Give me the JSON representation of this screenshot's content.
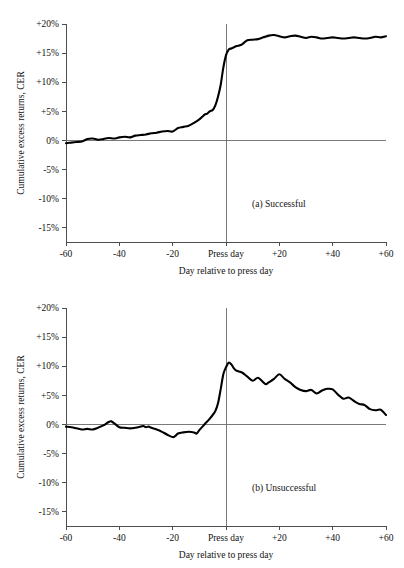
{
  "figure": {
    "title": "",
    "panels": [
      {
        "id": "a",
        "label": "(a)  Successful",
        "xlabel": "Day relative to press day",
        "ylabel": "Cumulative excess returns, CER"
      },
      {
        "id": "b",
        "label": "(b)  Unsuccessful",
        "xlabel": "Day relative to press day",
        "ylabel": "Cumulative excess returns, CER"
      }
    ],
    "y_tick_labels": [
      "+20%",
      "+15%",
      "+10%",
      "+5%",
      "0%",
      "-5%",
      "-10%",
      "-15%"
    ],
    "x_tick_labels": [
      "-60",
      "-40",
      "-20",
      "Press day",
      "+20",
      "+40",
      "+60"
    ],
    "colors": {
      "series": "#000000",
      "axis": "#4d4d4d",
      "reference": "#6b6b6b",
      "background": "#ffffff"
    }
  },
  "chart_data": [
    {
      "type": "line",
      "title": "(a)  Successful",
      "xlabel": "Day relative to press day",
      "ylabel": "Cumulative excess returns, CER",
      "xlim": [
        -60,
        60
      ],
      "ylim": [
        -17.5,
        20
      ],
      "xticks": [
        -60,
        -40,
        -20,
        0,
        20,
        40,
        60
      ],
      "xtick_labels": [
        "-60",
        "-40",
        "-20",
        "Press day",
        "+20",
        "+40",
        "+60"
      ],
      "yticks": [
        20,
        15,
        10,
        5,
        0,
        -5,
        -10,
        -15
      ],
      "ytick_labels": [
        "+20%",
        "+15%",
        "+10%",
        "+5%",
        "0%",
        "-5%",
        "-10%",
        "-15%"
      ],
      "grid": false,
      "legend": null,
      "reference_lines": [
        {
          "axis": "y",
          "value": 0
        },
        {
          "axis": "x",
          "value": 0,
          "label": "Press day"
        }
      ],
      "series": [
        {
          "name": "Successful",
          "x": [
            -60,
            -58,
            -56,
            -54,
            -52,
            -50,
            -48,
            -46,
            -44,
            -42,
            -40,
            -38,
            -36,
            -34,
            -32,
            -30,
            -28,
            -26,
            -24,
            -22,
            -20,
            -18,
            -16,
            -14,
            -12,
            -10,
            -9,
            -8,
            -7,
            -6,
            -5,
            -4,
            -3,
            -2,
            -1,
            0,
            1,
            2,
            3,
            4,
            5,
            6,
            8,
            10,
            12,
            14,
            16,
            18,
            20,
            22,
            24,
            26,
            28,
            30,
            32,
            34,
            36,
            38,
            40,
            42,
            44,
            46,
            48,
            50,
            52,
            54,
            56,
            58,
            60
          ],
          "values": [
            -0.5,
            -0.4,
            -0.3,
            -0.2,
            0.2,
            0.3,
            0.1,
            0.2,
            0.4,
            0.3,
            0.5,
            0.6,
            0.5,
            0.8,
            0.9,
            1.0,
            1.2,
            1.3,
            1.5,
            1.6,
            1.5,
            2.1,
            2.3,
            2.5,
            3.0,
            3.6,
            4.0,
            4.4,
            4.6,
            5.0,
            5.2,
            6.0,
            7.5,
            9.5,
            12.5,
            14.6,
            15.6,
            15.8,
            16.0,
            16.2,
            16.3,
            16.5,
            17.2,
            17.3,
            17.4,
            17.7,
            18.0,
            18.1,
            17.9,
            17.7,
            17.9,
            18.0,
            17.8,
            17.6,
            17.8,
            17.7,
            17.5,
            17.6,
            17.7,
            17.6,
            17.5,
            17.6,
            17.7,
            17.6,
            17.5,
            17.6,
            17.8,
            17.7,
            17.9
          ]
        }
      ]
    },
    {
      "type": "line",
      "title": "(b)  Unsuccessful",
      "xlabel": "Day relative to press day",
      "ylabel": "Cumulative excess returns, CER",
      "xlim": [
        -60,
        60
      ],
      "ylim": [
        -17.5,
        20
      ],
      "xticks": [
        -60,
        -40,
        -20,
        0,
        20,
        40,
        60
      ],
      "xtick_labels": [
        "-60",
        "-40",
        "-20",
        "Press day",
        "+20",
        "+40",
        "+60"
      ],
      "yticks": [
        20,
        15,
        10,
        5,
        0,
        -5,
        -10,
        -15
      ],
      "ytick_labels": [
        "+20%",
        "+15%",
        "+10%",
        "+5%",
        "0%",
        "-5%",
        "-10%",
        "-15%"
      ],
      "grid": false,
      "legend": null,
      "reference_lines": [
        {
          "axis": "y",
          "value": 0
        },
        {
          "axis": "x",
          "value": 0,
          "label": "Press day"
        }
      ],
      "series": [
        {
          "name": "Unsuccessful",
          "x": [
            -60,
            -58,
            -56,
            -54,
            -52,
            -50,
            -48,
            -46,
            -44,
            -43,
            -42,
            -40,
            -38,
            -36,
            -34,
            -32,
            -31,
            -30,
            -29,
            -28,
            -26,
            -24,
            -22,
            -20,
            -19,
            -18,
            -16,
            -14,
            -12,
            -11,
            -10,
            -8,
            -6,
            -4,
            -3,
            -2,
            -1,
            0,
            1,
            2,
            3,
            4,
            6,
            8,
            10,
            12,
            14,
            15,
            16,
            18,
            20,
            22,
            24,
            26,
            28,
            30,
            32,
            34,
            36,
            38,
            40,
            42,
            44,
            46,
            48,
            50,
            52,
            54,
            56,
            58,
            60
          ],
          "values": [
            -0.4,
            -0.5,
            -0.7,
            -0.9,
            -0.8,
            -0.9,
            -0.6,
            -0.2,
            0.4,
            0.5,
            0.2,
            -0.5,
            -0.6,
            -0.7,
            -0.6,
            -0.4,
            -0.3,
            -0.5,
            -0.4,
            -0.6,
            -0.9,
            -1.3,
            -1.8,
            -2.2,
            -2.0,
            -1.6,
            -1.4,
            -1.3,
            -1.4,
            -1.6,
            -1.0,
            0.0,
            1.0,
            2.3,
            3.6,
            6.0,
            8.6,
            9.8,
            10.6,
            10.3,
            9.6,
            9.2,
            8.9,
            8.2,
            7.5,
            8.0,
            7.2,
            6.9,
            7.2,
            7.8,
            8.6,
            7.8,
            7.2,
            6.4,
            5.9,
            5.7,
            5.9,
            5.3,
            5.8,
            6.1,
            6.0,
            5.1,
            4.4,
            4.6,
            4.0,
            3.5,
            3.3,
            2.6,
            2.4,
            2.5,
            1.6
          ]
        }
      ]
    }
  ]
}
